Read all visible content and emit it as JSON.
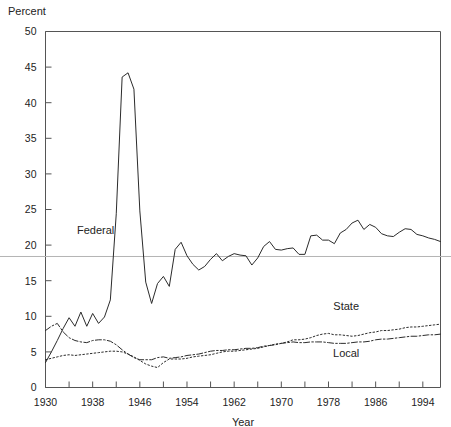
{
  "chart_data": {
    "type": "line",
    "title": "",
    "xlabel": "Year",
    "ylabel": "Percent",
    "ylabel_position": "top-left",
    "xlim": [
      1930,
      1997
    ],
    "ylim": [
      0,
      50
    ],
    "ytick_step": 5,
    "xtick_step": 4,
    "xtick_label_step": 8,
    "grid": false,
    "legend": "inline-annotations",
    "reference_line": {
      "value": 18.4,
      "orientation": "horizontal",
      "color": "#b5b5b5"
    },
    "ytick_labels": [
      "0",
      "5",
      "10",
      "15",
      "20",
      "25",
      "30",
      "35",
      "40",
      "45",
      "50"
    ],
    "ytick_values": [
      0,
      5,
      10,
      15,
      20,
      25,
      30,
      35,
      40,
      45,
      50
    ],
    "xtick_labels": [
      "1930",
      "1938",
      "1946",
      "1954",
      "1962",
      "1970",
      "1978",
      "1986",
      "1994"
    ],
    "xtick_values": [
      1930,
      1938,
      1946,
      1954,
      1962,
      1970,
      1978,
      1986,
      1994
    ],
    "annotations": [
      {
        "text": "Federal",
        "x": 1938.5,
        "y": 21.5
      },
      {
        "text": "State",
        "x": 1981.0,
        "y": 10.9
      },
      {
        "text": "Local",
        "x": 1981.0,
        "y": 4.3
      }
    ],
    "x": [
      1930,
      1931,
      1932,
      1933,
      1934,
      1935,
      1936,
      1937,
      1938,
      1939,
      1940,
      1941,
      1942,
      1943,
      1944,
      1945,
      1946,
      1947,
      1948,
      1949,
      1950,
      1951,
      1952,
      1953,
      1954,
      1955,
      1956,
      1957,
      1958,
      1959,
      1960,
      1961,
      1962,
      1963,
      1964,
      1965,
      1966,
      1967,
      1968,
      1969,
      1970,
      1971,
      1972,
      1973,
      1974,
      1975,
      1976,
      1977,
      1978,
      1979,
      1980,
      1981,
      1982,
      1983,
      1984,
      1985,
      1986,
      1987,
      1988,
      1989,
      1990,
      1991,
      1992,
      1993,
      1994,
      1995,
      1996,
      1997
    ],
    "series": [
      {
        "name": "Federal",
        "style": "solid",
        "color": "#2b2b2b",
        "values": [
          3.5,
          5.0,
          6.6,
          8.3,
          9.8,
          8.6,
          10.6,
          8.6,
          10.4,
          9.0,
          9.9,
          12.3,
          24.4,
          43.6,
          44.2,
          41.9,
          24.8,
          14.8,
          11.8,
          14.6,
          15.6,
          14.2,
          19.4,
          20.4,
          18.5,
          17.3,
          16.5,
          17.0,
          18.0,
          18.8,
          17.8,
          18.4,
          18.8,
          18.6,
          18.5,
          17.2,
          18.2,
          19.8,
          20.5,
          19.4,
          19.3,
          19.5,
          19.6,
          18.7,
          18.7,
          21.3,
          21.4,
          20.7,
          20.7,
          20.2,
          21.7,
          22.2,
          23.1,
          23.5,
          22.2,
          22.9,
          22.5,
          21.6,
          21.3,
          21.2,
          21.8,
          22.3,
          22.2,
          21.5,
          21.3,
          21.0,
          20.8,
          20.5
        ]
      },
      {
        "name": "State",
        "style": "dotted",
        "color": "#2b2b2b",
        "values": [
          3.9,
          4.1,
          4.3,
          4.5,
          4.6,
          4.5,
          4.6,
          4.7,
          4.8,
          4.9,
          5.0,
          5.1,
          5.1,
          5.0,
          4.7,
          4.3,
          3.8,
          3.3,
          3.0,
          2.8,
          3.5,
          4.0,
          4.0,
          4.0,
          4.1,
          4.3,
          4.4,
          4.5,
          4.6,
          4.8,
          5.0,
          5.1,
          5.1,
          5.2,
          5.3,
          5.4,
          5.5,
          5.7,
          5.9,
          6.1,
          6.2,
          6.4,
          6.7,
          6.7,
          6.8,
          7.0,
          7.3,
          7.5,
          7.6,
          7.4,
          7.4,
          7.3,
          7.2,
          7.3,
          7.5,
          7.7,
          7.8,
          8.0,
          8.0,
          8.1,
          8.2,
          8.4,
          8.5,
          8.5,
          8.6,
          8.7,
          8.8,
          8.9
        ]
      },
      {
        "name": "Local",
        "style": "dashdot",
        "color": "#2b2b2b",
        "values": [
          8.0,
          8.6,
          9.0,
          7.8,
          7.0,
          6.6,
          6.4,
          6.3,
          6.6,
          6.7,
          6.7,
          6.5,
          6.0,
          5.3,
          4.7,
          4.2,
          3.9,
          3.9,
          3.9,
          4.2,
          4.3,
          4.1,
          4.2,
          4.3,
          4.5,
          4.6,
          4.7,
          4.9,
          5.1,
          5.2,
          5.2,
          5.3,
          5.3,
          5.4,
          5.5,
          5.5,
          5.6,
          5.8,
          5.9,
          6.0,
          6.2,
          6.3,
          6.4,
          6.3,
          6.3,
          6.4,
          6.4,
          6.4,
          6.3,
          6.2,
          6.2,
          6.2,
          6.3,
          6.4,
          6.4,
          6.5,
          6.7,
          6.8,
          6.8,
          6.9,
          7.0,
          7.1,
          7.2,
          7.2,
          7.3,
          7.4,
          7.4,
          7.5
        ]
      }
    ]
  }
}
